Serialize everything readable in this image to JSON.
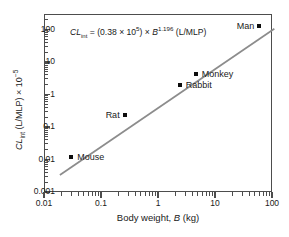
{
  "chart_data": {
    "type": "scatter",
    "title": "",
    "equation": {
      "lhs": "CL",
      "lhs_sub": "int",
      "eq": " = (0.38 × 10",
      "coef_exp": "5",
      "mid": ") × ",
      "var": "B",
      "var_exp": "1.196",
      "units": " (L/MLP)",
      "full_text": "CLint = (0.38 x 10^5) x B^1.196 (L/MLP)"
    },
    "xlabel": "Body weight, B (kg)",
    "xlabel_parts": {
      "pre": "Body weight, ",
      "ital": "B",
      "post": " (kg)"
    },
    "ylabel": "CLint (L/MLP) x 10^-5",
    "ylabel_parts": {
      "lhs": "CL",
      "sub": "int",
      "mid": " (L/MLP) × 10",
      "exp": "−5"
    },
    "xscale": "log",
    "yscale": "log",
    "xlim": [
      0.01,
      100
    ],
    "ylim": [
      0.001,
      300
    ],
    "xticks": [
      0.01,
      0.1,
      1,
      10,
      100
    ],
    "xticklabels": [
      "0.01",
      "0.1",
      "1",
      "10",
      "100"
    ],
    "yticks": [
      0.001,
      0.01,
      0.1,
      1,
      10,
      100
    ],
    "yticklabels": [
      "0.001",
      "0.01",
      "0.1",
      "1",
      "10",
      "100"
    ],
    "grid": false,
    "legend": false,
    "points": [
      {
        "label": "Mouse",
        "x": 0.03,
        "y": 0.012,
        "label_side": "right"
      },
      {
        "label": "Rat",
        "x": 0.26,
        "y": 0.24,
        "label_side": "left"
      },
      {
        "label": "Rabbit",
        "x": 2.4,
        "y": 1.9,
        "label_side": "right"
      },
      {
        "label": "Monkey",
        "x": 4.6,
        "y": 4.4,
        "label_side": "right"
      },
      {
        "label": "Man",
        "x": 60,
        "y": 130,
        "label_side": "left"
      }
    ],
    "fit_line": {
      "type": "power",
      "coefficient": 0.38,
      "coefficient_scale": 100000,
      "exponent": 1.196,
      "color": "#8c8c8c",
      "x_start": 0.019,
      "x_end": 110
    }
  }
}
